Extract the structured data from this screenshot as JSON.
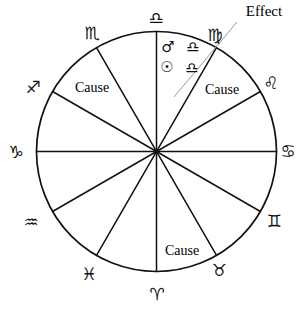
{
  "figure": {
    "type": "astrological-chart-wheel",
    "title": "",
    "geometry": {
      "width": 306,
      "height": 315,
      "center_x": 156.5,
      "center_y": 151.5,
      "radius": 120,
      "sector_count": 12,
      "spoke_offset_degrees": 0
    },
    "colors": {
      "stroke": "#111111",
      "background": "#ffffff",
      "leader_line": "#9a9a9a",
      "text": "#000000"
    }
  },
  "zodiac_signs": [
    {
      "name": "libra",
      "symbol": "♎",
      "label": "Libra",
      "x": 156,
      "y": 18,
      "angle_deg": 90
    },
    {
      "name": "virgo",
      "symbol": "♍",
      "label": "Virgo",
      "x": 215,
      "y": 35,
      "angle_deg": 60
    },
    {
      "name": "leo",
      "symbol": "♌",
      "label": "Leo",
      "x": 271,
      "y": 83,
      "angle_deg": 30
    },
    {
      "name": "cancer",
      "symbol": "♋",
      "label": "Cancer",
      "x": 288,
      "y": 151,
      "angle_deg": 0
    },
    {
      "name": "gemini",
      "symbol": "♊",
      "label": "Gemini",
      "x": 274,
      "y": 221,
      "angle_deg": -30
    },
    {
      "name": "taurus",
      "symbol": "♉",
      "label": "Taurus",
      "x": 219,
      "y": 270,
      "angle_deg": -60
    },
    {
      "name": "aries",
      "symbol": "♈",
      "label": "Aries",
      "x": 157,
      "y": 294,
      "angle_deg": -90
    },
    {
      "name": "pisces",
      "symbol": "♓",
      "label": "Pisces",
      "x": 89,
      "y": 274,
      "angle_deg": -120
    },
    {
      "name": "aquarius",
      "symbol": "♒",
      "label": "Aquarius",
      "x": 31,
      "y": 222,
      "angle_deg": -150
    },
    {
      "name": "capricorn",
      "symbol": "♑",
      "label": "Capricorn",
      "x": 16,
      "y": 152,
      "angle_deg": 180
    },
    {
      "name": "sagittarius",
      "symbol": "♐",
      "label": "Sagittarius",
      "x": 33,
      "y": 87,
      "angle_deg": 150
    },
    {
      "name": "scorpio",
      "symbol": "♏",
      "label": "Scorpio",
      "x": 92,
      "y": 33,
      "angle_deg": 120
    }
  ],
  "placements": [
    {
      "name": "mars-in-libra",
      "planet_symbol": "♂",
      "planet_label": "Mars",
      "sign_symbol": "♎",
      "sign_label": "Libra",
      "planet_x": 168,
      "planet_y": 47,
      "sign_x": 193,
      "sign_y": 47
    },
    {
      "name": "sun-in-libra",
      "planet_symbol": "☉",
      "planet_label": "Sun",
      "sign_symbol": "♎",
      "sign_label": "Libra",
      "planet_x": 167,
      "planet_y": 67,
      "sign_x": 192,
      "sign_y": 68
    }
  ],
  "annotations": [
    {
      "name": "cause-label-upper-left",
      "text": "Cause",
      "x": 92,
      "y": 88
    },
    {
      "name": "cause-label-upper-right",
      "text": "Cause",
      "x": 222,
      "y": 90
    },
    {
      "name": "cause-label-bottom",
      "text": "Cause",
      "x": 182,
      "y": 251
    },
    {
      "name": "effect-label",
      "text": "Effect",
      "x": 264,
      "y": 11
    }
  ],
  "leader_line": {
    "name": "effect-leader-line",
    "x1": 237,
    "y1": 22,
    "x2": 174,
    "y2": 97
  }
}
